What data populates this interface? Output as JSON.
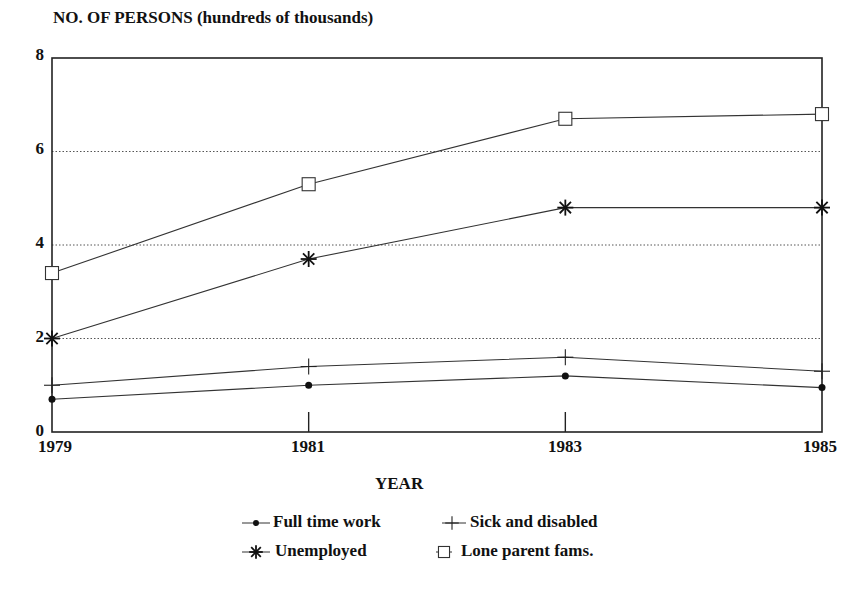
{
  "chart_data": {
    "type": "line",
    "title": "",
    "ylabel": "NO. OF PERSONS",
    "ylabel_unit": "(hundreds of thousands)",
    "xlabel": "YEAR",
    "x": [
      "1979",
      "1981",
      "1983",
      "1985"
    ],
    "yticks": [
      "0",
      "2",
      "4",
      "6",
      "8"
    ],
    "ylim": [
      0,
      8
    ],
    "grid": {
      "horizontal_dotted": [
        2,
        4,
        6
      ]
    },
    "legend_position": "bottom-center",
    "series": [
      {
        "name": "Full time work",
        "marker": "filled-circle",
        "values": [
          0.7,
          1.0,
          1.2,
          0.95
        ]
      },
      {
        "name": "Sick and disabled",
        "marker": "plus",
        "values": [
          1.0,
          1.4,
          1.6,
          1.3
        ]
      },
      {
        "name": "Unemployed",
        "marker": "asterisk",
        "values": [
          2.0,
          3.7,
          4.8,
          4.8
        ]
      },
      {
        "name": "Lone parent fams.",
        "marker": "open-square",
        "values": [
          3.4,
          5.3,
          6.7,
          6.8
        ]
      }
    ]
  },
  "labels": {
    "ylabel_main": "NO. OF PERSONS",
    "ylabel_unit": "(hundreds of thousands)",
    "xlabel": "YEAR",
    "yticks": [
      "0",
      "2",
      "4",
      "6",
      "8"
    ],
    "xticks": [
      "1979",
      "1981",
      "1983",
      "1985"
    ],
    "legend": [
      "Full time work",
      "Sick and disabled",
      "Unemployed",
      "Lone parent fams."
    ]
  }
}
